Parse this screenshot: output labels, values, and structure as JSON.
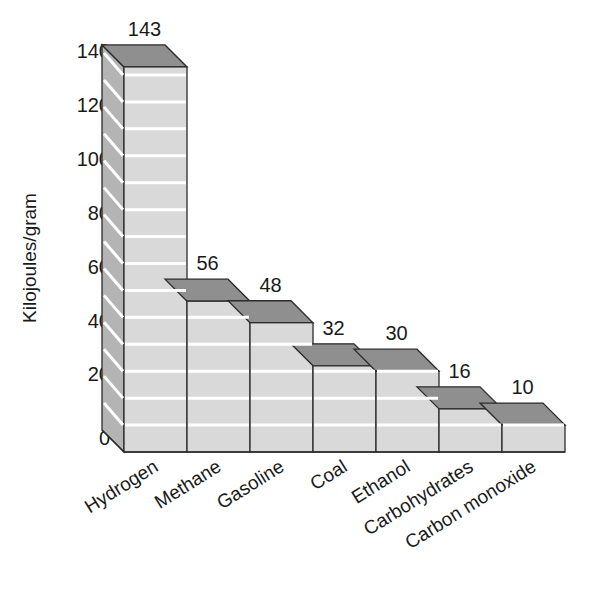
{
  "chart_data": {
    "type": "bar",
    "title": "",
    "subtitle": "",
    "xlabel": "",
    "ylabel": "Kilojoules/gram",
    "categories": [
      "Hydrogen",
      "Methane",
      "Gasoline",
      "Coal",
      "Ethanol",
      "Carbohydrates",
      "Carbon monoxide"
    ],
    "values": [
      143,
      56,
      48,
      32,
      30,
      16,
      10
    ],
    "value_labels": [
      "143",
      "56",
      "48",
      "32",
      "30",
      "16",
      "10"
    ],
    "ylim": [
      0,
      140
    ],
    "y_ticks": [
      0,
      20,
      40,
      60,
      80,
      100,
      120,
      140
    ],
    "y_tick_labels": [
      "0",
      "20",
      "40",
      "60",
      "80",
      "100",
      "120",
      "140"
    ],
    "grid": true,
    "gridline_interval": 10,
    "gridline_color": "#ffffff",
    "legend": "none",
    "style": "3d-bar",
    "bar_front_color": "#d9d9d9",
    "bar_top_color": "#8f8f8f",
    "bar_side_color": "#b4b4b4",
    "bar_edge_color": "#2b2b2b",
    "background_color": "#ffffff",
    "text_color": "#1a1a1a",
    "category_label_rotation_deg": 32
  }
}
